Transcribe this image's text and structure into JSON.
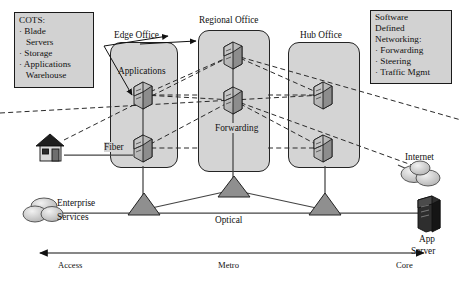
{
  "diagram": {
    "colors": {
      "panel_fill": "#d4d4d4",
      "note_fill": "#d2d2d2",
      "stroke": "#1a1a1a",
      "node_fill": "#b9b9b9",
      "app_server_fill": "#2e2e2e"
    },
    "notes": [
      {
        "id": "cots",
        "heading": "COTS:",
        "items": [
          "· Blade",
          "   Servers",
          "· Storage",
          "· Applications",
          "   Warehouse"
        ]
      },
      {
        "id": "sdn",
        "heading": "Software",
        "items": [
          "Defined",
          "Networking:",
          "· Forwarding",
          "· Steering",
          "· Traffic Mgmt"
        ]
      }
    ],
    "columns": [
      {
        "id": "edge",
        "label": "Edge Office"
      },
      {
        "id": "regional",
        "label": "Regional Office"
      },
      {
        "id": "hub",
        "label": "Hub Office"
      }
    ],
    "inline_labels": [
      {
        "id": "applications",
        "text": "Applications"
      },
      {
        "id": "forwarding",
        "text": "Forwarding"
      },
      {
        "id": "fiber",
        "text": "Fiber"
      },
      {
        "id": "optical",
        "text": "Optical"
      }
    ],
    "endpoints": [
      {
        "id": "house",
        "label": ""
      },
      {
        "id": "internet",
        "label": "Internet"
      },
      {
        "id": "enterprise",
        "label_line1": "Enterprise",
        "label_line2": "Services"
      },
      {
        "id": "appserver",
        "label_line1": "App",
        "label_line2": "Server"
      }
    ],
    "axis": {
      "segments": [
        "Access",
        "Metro",
        "Core"
      ],
      "arrow": "double-headed"
    },
    "node_counts": {
      "edge": 2,
      "regional": 2,
      "hub": 2,
      "switches": 3
    }
  }
}
